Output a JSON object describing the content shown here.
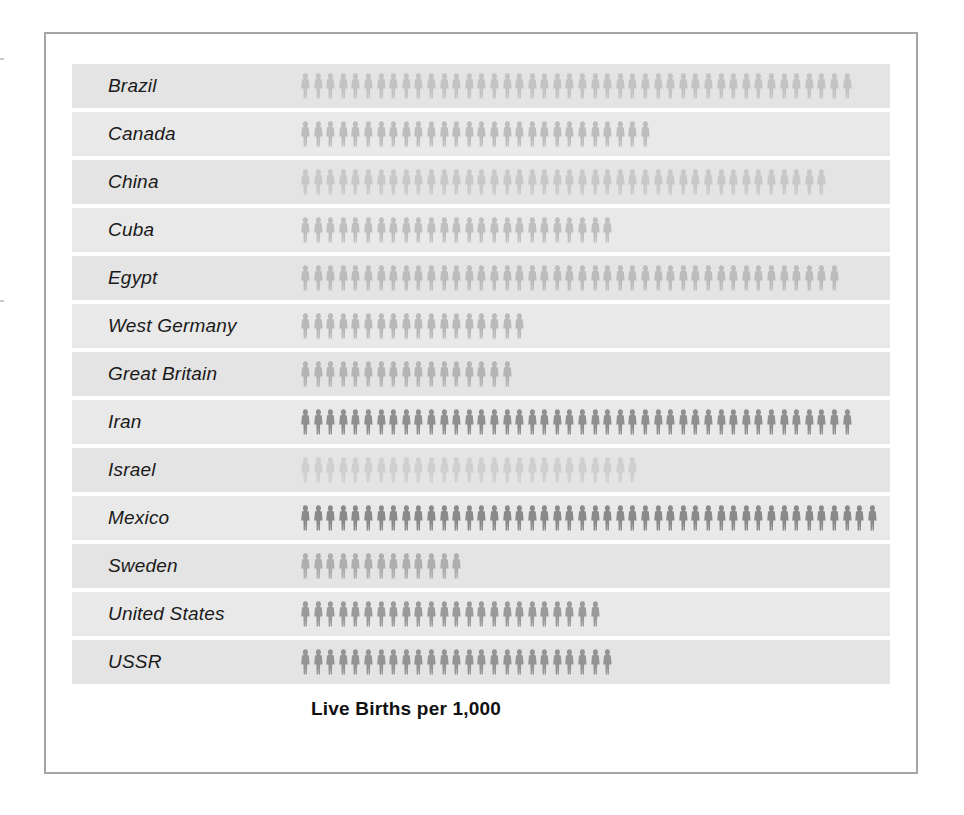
{
  "chart_data": {
    "type": "bar",
    "subtype": "pictogram",
    "title": "Live Births per 1,000",
    "xlabel": "",
    "ylabel": "",
    "unit_label": "one figure = 1 live birth per 1,000",
    "legend": [],
    "grid": false,
    "categories": [
      "Brazil",
      "Canada",
      "China",
      "Cuba",
      "Egypt",
      "West Germany",
      "Great Britain",
      "Iran",
      "Israel",
      "Mexico",
      "Sweden",
      "United States",
      "USSR"
    ],
    "values": [
      44,
      28,
      42,
      25,
      43,
      18,
      17,
      44,
      27,
      46,
      13,
      24,
      25
    ],
    "xlim": [
      0,
      48
    ]
  },
  "rows": [
    {
      "label": "Brazil",
      "count": 44,
      "color": "#c3c3c3"
    },
    {
      "label": "Canada",
      "count": 28,
      "color": "#bdbdbd"
    },
    {
      "label": "China",
      "count": 42,
      "color": "#c8c8c8"
    },
    {
      "label": "Cuba",
      "count": 25,
      "color": "#bfbfbf"
    },
    {
      "label": "Egypt",
      "count": 43,
      "color": "#bcbcbc"
    },
    {
      "label": "West Germany",
      "count": 18,
      "color": "#b9b9b9"
    },
    {
      "label": "Great Britain",
      "count": 17,
      "color": "#b4b4b4"
    },
    {
      "label": "Iran",
      "count": 44,
      "color": "#8f8f8f"
    },
    {
      "label": "Israel",
      "count": 27,
      "color": "#cfcfcf"
    },
    {
      "label": "Mexico",
      "count": 46,
      "color": "#8a8a8a"
    },
    {
      "label": "Sweden",
      "count": 13,
      "color": "#aeaeae"
    },
    {
      "label": "United States",
      "count": 24,
      "color": "#9a9a9a"
    },
    {
      "label": "USSR",
      "count": 25,
      "color": "#949494"
    }
  ],
  "colors": {
    "panel_background": "#e4e4e4",
    "frame_border": "#a6a6a6",
    "page_background": "#ffffff",
    "label_text": "#1a1a1a",
    "title_text": "#111111"
  }
}
